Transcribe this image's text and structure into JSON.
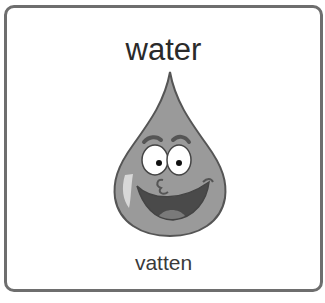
{
  "card": {
    "word": "water",
    "translation": "vatten",
    "illustration": "smiling-water-drop-icon",
    "colors": {
      "border": "#6e6e6e",
      "drop_fill": "#9a9a9a",
      "drop_outline": "#555555",
      "text": "#2a2a2a"
    }
  }
}
